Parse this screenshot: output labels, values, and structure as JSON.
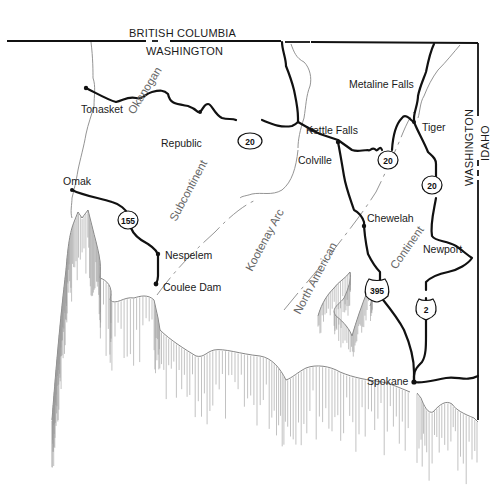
{
  "map": {
    "boundaries": {
      "north_upper": "BRITISH COLUMBIA",
      "north_lower": "WASHINGTON",
      "east_left": "WASHINGTON",
      "east_right": "IDAHO"
    },
    "cities": [
      {
        "name": "Tonasket"
      },
      {
        "name": "Republic"
      },
      {
        "name": "Omak"
      },
      {
        "name": "Nespelem"
      },
      {
        "name": "Coulee Dam"
      },
      {
        "name": "Kettle Falls"
      },
      {
        "name": "Colville"
      },
      {
        "name": "Metaline Falls"
      },
      {
        "name": "Tiger"
      },
      {
        "name": "Chewelah"
      },
      {
        "name": "Newport"
      },
      {
        "name": "Spokane"
      }
    ],
    "geologic_labels": [
      {
        "text": "Okanogan"
      },
      {
        "text": "Subcontinent"
      },
      {
        "text": "Kootenay Arc"
      },
      {
        "text": "North American"
      },
      {
        "text": "Continent"
      }
    ],
    "highways": [
      {
        "number": "20",
        "type": "state"
      },
      {
        "number": "20",
        "type": "state"
      },
      {
        "number": "20",
        "type": "state"
      },
      {
        "number": "155",
        "type": "state"
      },
      {
        "number": "395",
        "type": "us"
      },
      {
        "number": "2",
        "type": "us"
      }
    ]
  }
}
